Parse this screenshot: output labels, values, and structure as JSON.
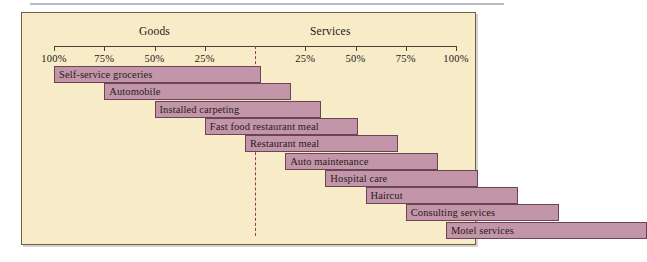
{
  "figure": {
    "headings": {
      "goods": "Goods",
      "services": "Services"
    }
  },
  "chart_data": {
    "type": "bar",
    "subtype": "diverging-horizontal-stacked-continuum",
    "title": "",
    "xlabel": "",
    "ylabel": "",
    "axis": {
      "left_section": "Goods",
      "right_section": "Services",
      "tick_labels": [
        "100%",
        "75%",
        "50%",
        "25%",
        "",
        "25%",
        "50%",
        "75%",
        "100%"
      ],
      "tick_values": [
        -100,
        -75,
        -50,
        -25,
        0,
        25,
        50,
        75,
        100
      ],
      "range": [
        -100,
        100
      ],
      "center_marker": "dashed",
      "grid": false,
      "legend": "none"
    },
    "note": "Each bar spans from its goods percentage (left of center) to its services percentage (right of center); total width equals 100%.",
    "categories": [
      "Self-service groceries",
      "Automobile",
      "Installed carpeting",
      "Fast food restaurant meal",
      "Restaurant meal",
      "Auto maintenance",
      "Hospital care",
      "Haircut",
      "Consulting services",
      "Motel services"
    ],
    "series": [
      {
        "name": "Goods",
        "values": [
          100,
          75,
          50,
          25,
          5,
          -15,
          -35,
          -55,
          -75,
          -95
        ]
      },
      {
        "name": "Services",
        "values": [
          0,
          25,
          50,
          75,
          95,
          100,
          100,
          100,
          100,
          100
        ]
      }
    ],
    "bars": [
      {
        "label": "Self-service groceries",
        "start": -100,
        "end": 3,
        "label_align": "left"
      },
      {
        "label": "Automobile",
        "start": -75,
        "end": 18,
        "label_align": "left"
      },
      {
        "label": "Installed carpeting",
        "start": -50,
        "end": 33,
        "label_align": "left"
      },
      {
        "label": "Fast food restaurant meal",
        "start": -25,
        "end": 51,
        "label_align": "left"
      },
      {
        "label": "Restaurant meal",
        "start": -5,
        "end": 71,
        "label_align": "left"
      },
      {
        "label": "Auto maintenance",
        "start": 15,
        "end": 91,
        "label_align": "left"
      },
      {
        "label": "Hospital care",
        "start": 35,
        "end": 111,
        "label_align": "left"
      },
      {
        "label": "Haircut",
        "start": 55,
        "end": 131,
        "label_align": "left"
      },
      {
        "label": "Consulting services",
        "start": 75,
        "end": 151,
        "label_align": "left"
      },
      {
        "label": "Motel services",
        "start": 95,
        "end": 195,
        "label_align": "left"
      }
    ]
  }
}
